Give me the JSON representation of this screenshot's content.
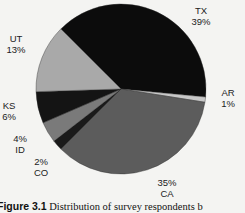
{
  "chart_data": {
    "type": "pie",
    "title": "",
    "caption_label": "Figure 3.1",
    "caption_text": "Distribution of survey respondents b",
    "start_angle_deg": -135,
    "direction": "clockwise",
    "slices": [
      {
        "label": "TX",
        "value": 39,
        "pct": "39%",
        "color": "#0c0c0c",
        "lx": 201,
        "ly": 14,
        "order": "label-first"
      },
      {
        "label": "AR",
        "value": 1,
        "pct": "1%",
        "color": "#c8c8c8",
        "lx": 228,
        "ly": 96,
        "order": "label-first"
      },
      {
        "label": "CA",
        "value": 35,
        "pct": "35%",
        "color": "#5c5c5c",
        "lx": 167,
        "ly": 186,
        "order": "pct-first"
      },
      {
        "label": "CO",
        "value": 2,
        "pct": "2%",
        "color": "#1a1a1a",
        "lx": 41,
        "ly": 165,
        "order": "pct-first"
      },
      {
        "label": "ID",
        "value": 4,
        "pct": "4%",
        "color": "#7a7a7a",
        "lx": 20,
        "ly": 142,
        "order": "pct-first"
      },
      {
        "label": "KS",
        "value": 6,
        "pct": "6%",
        "color": "#141414",
        "lx": 9,
        "ly": 109,
        "order": "label-first"
      },
      {
        "label": "UT",
        "value": 13,
        "pct": "13%",
        "color": "#a9a9a9",
        "lx": 16,
        "ly": 42,
        "order": "label-first"
      }
    ],
    "center": [
      121,
      89
    ],
    "radius": 85
  }
}
